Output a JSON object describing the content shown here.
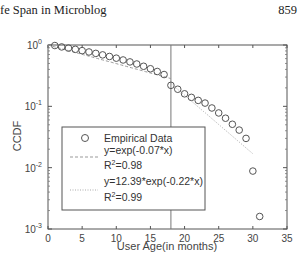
{
  "page": {
    "running_header": "fe Span in Microblog",
    "page_number": "859"
  },
  "chart_data": {
    "type": "scatter",
    "title": "",
    "xlabel": "User Age(in months)",
    "ylabel": "CCDF",
    "xlim": [
      0,
      35
    ],
    "ylim": [
      0.001,
      1
    ],
    "yscale": "log",
    "x_ticks": [
      "0",
      "5",
      "10",
      "15",
      "20",
      "25",
      "30",
      "35"
    ],
    "y_ticks": [
      "10^0",
      "10^-1",
      "10^-2",
      "10^-3"
    ],
    "grid": false,
    "vertical_reference_line_x": 18,
    "legend_position": "inside-lower-left",
    "legend": [
      {
        "marker": "circle",
        "label": "Empirical Data"
      },
      {
        "marker": "dashed-line",
        "label": "y=exp(-0.07*x)",
        "r2_label": "R",
        "r2_sup": "2",
        "r2_value": "=0.98"
      },
      {
        "marker": "dotted-line",
        "label": "y=12.39*exp(-0.22*x)",
        "r2_label": "R",
        "r2_sup": "2",
        "r2_value": "=0.99"
      }
    ],
    "series": [
      {
        "name": "Empirical Data",
        "x": [
          1,
          2,
          3,
          4,
          5,
          6,
          7,
          8,
          9,
          10,
          11,
          12,
          13,
          14,
          15,
          16,
          17,
          18,
          19,
          20,
          21,
          22,
          23,
          24,
          25,
          26,
          27,
          28,
          29,
          30,
          31
        ],
        "y": [
          0.98,
          0.93,
          0.89,
          0.85,
          0.81,
          0.77,
          0.73,
          0.69,
          0.65,
          0.61,
          0.57,
          0.53,
          0.49,
          0.45,
          0.41,
          0.37,
          0.33,
          0.22,
          0.19,
          0.16,
          0.14,
          0.125,
          0.113,
          0.094,
          0.078,
          0.064,
          0.051,
          0.041,
          0.03,
          0.0088,
          0.0016
        ]
      },
      {
        "name": "y=exp(-0.07*x)",
        "fit": {
          "a": 1.0,
          "b": -0.07
        },
        "x_range": [
          0,
          18
        ]
      },
      {
        "name": "y=12.39*exp(-0.22*x)",
        "fit": {
          "a": 12.39,
          "b": -0.22
        },
        "x_range": [
          18,
          30
        ]
      }
    ]
  }
}
